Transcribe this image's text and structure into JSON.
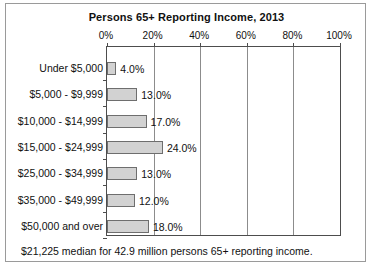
{
  "figure": {
    "title": "Persons 65+ Reporting Income, 2013",
    "footnote": "$21,225 median for 42.9 million persons 65+ reporting income.",
    "bar_fill": "#d2d2d2",
    "bar_stroke": "#6e6e6e",
    "axis_color": "#4d4d4d",
    "grid_color": "#8c8c8c",
    "frame_color": "#9a9a9a"
  },
  "chart_data": {
    "type": "bar",
    "orientation": "horizontal",
    "title": "Persons 65+ Reporting Income, 2013",
    "xlabel": "",
    "ylabel": "",
    "xlim": [
      0,
      100
    ],
    "xticks": [
      0,
      20,
      40,
      60,
      80,
      100
    ],
    "xtick_labels": [
      "0%",
      "20%",
      "40%",
      "60%",
      "80%",
      "100%"
    ],
    "grid": true,
    "legend": null,
    "categories": [
      "Under $5,000",
      "$5,000 - $9,999",
      "$10,000 - $14,999",
      "$15,000 - $24,999",
      "$25,000 - $34,999",
      "$35,000 - $49,999",
      "$50,000 and over"
    ],
    "values": [
      4.0,
      13.0,
      17.0,
      24.0,
      13.0,
      12.0,
      18.0
    ],
    "data_labels": [
      "4.0%",
      "13.0%",
      "17.0%",
      "24.0%",
      "13.0%",
      "12.0%",
      "18.0%"
    ],
    "annotation": "$21,225 median for 42.9 million persons 65+ reporting income."
  }
}
